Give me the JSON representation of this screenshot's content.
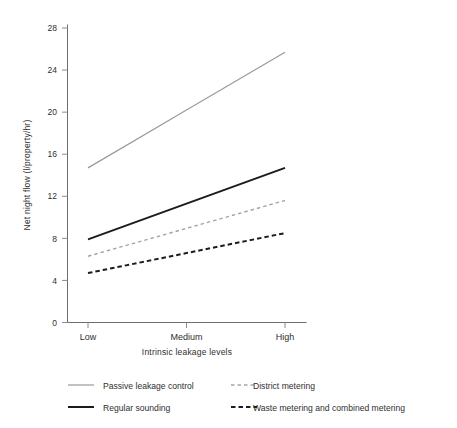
{
  "chart_data": {
    "type": "line",
    "title": "",
    "xlabel": "Intrinsic leakage levels",
    "ylabel": "Net night flow (l/property/hr)",
    "categories": [
      "Low",
      "Medium",
      "High"
    ],
    "yticks": [
      0,
      4,
      8,
      12,
      16,
      20,
      24,
      28
    ],
    "ylim": [
      0,
      28
    ],
    "grid": false,
    "legend_position": "bottom",
    "series": [
      {
        "name": "Passive leakage control",
        "values": [
          14.7,
          20.2,
          25.7
        ],
        "color": "#9a9a9a",
        "style": "solid",
        "width": 1.2
      },
      {
        "name": "Regular sounding",
        "values": [
          7.9,
          11.3,
          14.7
        ],
        "color": "#1c1c1c",
        "style": "solid",
        "width": 2.0
      },
      {
        "name": "District metering",
        "values": [
          6.3,
          8.95,
          11.6
        ],
        "color": "#a5a5a5",
        "style": "dashed",
        "width": 1.4
      },
      {
        "name": "Waste metering and combined metering",
        "values": [
          4.7,
          6.6,
          8.5
        ],
        "color": "#1c1c1c",
        "style": "dashed",
        "width": 2.0
      }
    ]
  },
  "axes": {
    "y_title": "Net night flow (l/property/hr)",
    "x_title": "Intrinsic leakage levels",
    "y_tick_labels": [
      "28",
      "24",
      "20",
      "16",
      "12",
      "8",
      "4",
      "0"
    ],
    "x_tick_labels": [
      "Low",
      "Medium",
      "High"
    ]
  },
  "legend": {
    "entries": [
      {
        "label": "Passive leakage control"
      },
      {
        "label": "District metering"
      },
      {
        "label": "Regular sounding"
      },
      {
        "label": "Waste metering and combined metering"
      }
    ]
  }
}
